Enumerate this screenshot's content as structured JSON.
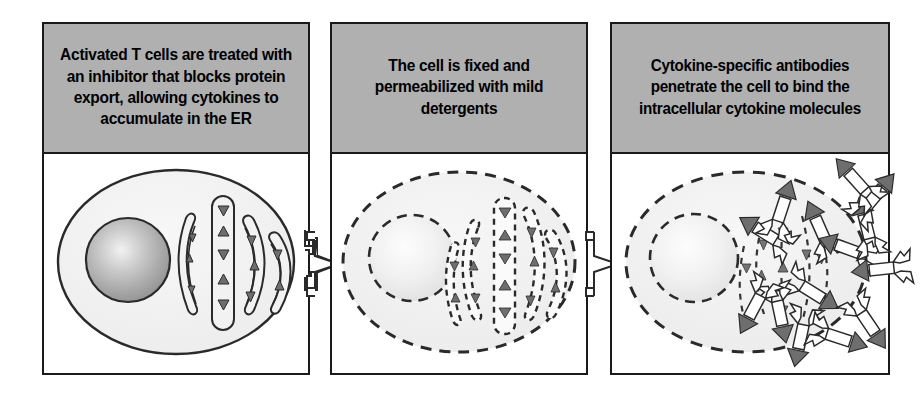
{
  "figure": {
    "type": "process-diagram",
    "panel_count": 3,
    "colors": {
      "header_gray": "#b0b0b0",
      "outline_black": "#1a1a1a",
      "cell_fill": "#f0f0f0",
      "nucleus_dark": "#9a9a9a",
      "nucleus_light": "#f7f7f7",
      "cytokine_fill": "#6e6e6e",
      "antibody_fill": "#ffffff",
      "page_background": "#ffffff"
    }
  },
  "panels": [
    {
      "index": 1,
      "caption": "Activated T cells are treated with an inhibitor that blocks protein export, allowing cytokines to accumulate in the ER",
      "illustration": {
        "name": "intact-activated-t-cell",
        "membrane_style": "solid",
        "nucleus_style": "solid-shaded",
        "er_style": "solid",
        "er_count": 4,
        "cytokine_count": 15,
        "antibody_count": 0
      }
    },
    {
      "index": 2,
      "caption": "The cell is fixed and permeabilized with mild detergents",
      "illustration": {
        "name": "permeabilized-cell",
        "membrane_style": "dashed",
        "nucleus_style": "dashed-light",
        "er_style": "dashed",
        "er_count": 5,
        "cytokine_count": 17,
        "antibody_count": 0
      }
    },
    {
      "index": 3,
      "caption": "Cytokine-specific antibodies penetrate the cell to bind the intracellular cytokine molecules",
      "illustration": {
        "name": "antibody-bound-cell",
        "membrane_style": "dashed",
        "nucleus_style": "dashed-light",
        "er_style": "dashed",
        "er_count": 5,
        "cytokine_count": 14,
        "antibody_count": 14
      }
    }
  ],
  "connectors": [
    {
      "name": "arrow-panel1-to-panel2",
      "direction": "right",
      "shape": "notched-block-arrow"
    },
    {
      "name": "arrow-panel2-to-panel3",
      "direction": "right",
      "shape": "notched-block-arrow"
    }
  ]
}
